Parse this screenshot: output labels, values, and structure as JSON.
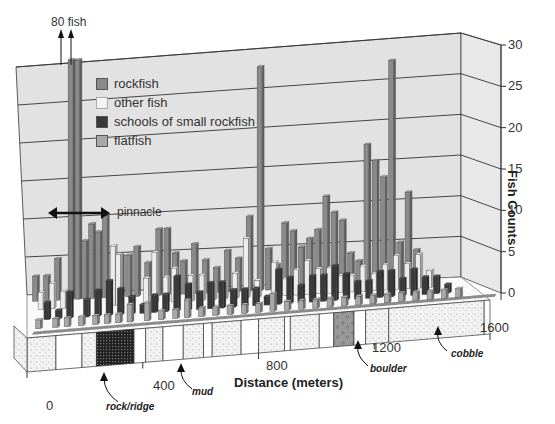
{
  "chart_data": {
    "type": "bar",
    "subtype": "3d-bar",
    "title": "",
    "xlabel": "Distance (meters)",
    "ylabel": "Fish Counts",
    "ylim": [
      0,
      30
    ],
    "xlim": [
      0,
      1600
    ],
    "yticks": [
      0,
      5,
      10,
      15,
      20,
      25,
      30
    ],
    "xticks": [
      0,
      400,
      800,
      1200,
      1600
    ],
    "grid": true,
    "legend_position": "upper-left inside",
    "legend": [
      {
        "name": "rockfish",
        "color": "#8a8a8a"
      },
      {
        "name": "other fish",
        "color": "#ececec"
      },
      {
        "name": "schools of small rockfish",
        "color": "#3a3a3a"
      },
      {
        "name": "flatfish",
        "color": "#a8a8a8"
      }
    ],
    "annotations": [
      {
        "text": "80 fish",
        "target": "two off-scale rockfish bars near 150 m",
        "value": 80
      },
      {
        "text": "pinnacle",
        "type": "double-arrow",
        "span_m": [
          60,
          260
        ]
      }
    ],
    "series": [
      {
        "name": "rockfish",
        "x": [
          20,
          60,
          100,
          150,
          175,
          200,
          225,
          250,
          275,
          330,
          360,
          390,
          430,
          470,
          500,
          530,
          560,
          600,
          640,
          680,
          720,
          760,
          800,
          840,
          870,
          900,
          930,
          960,
          990,
          1020,
          1050,
          1080,
          1110,
          1140,
          1170,
          1200,
          1230,
          1260,
          1290,
          1320,
          1350,
          1380,
          1410
        ],
        "values": [
          3,
          3,
          5,
          80,
          80,
          7,
          9,
          8,
          10,
          5,
          5,
          6,
          4,
          8,
          8,
          5,
          4,
          6,
          4,
          3,
          5,
          4,
          9,
          27,
          5,
          3,
          8,
          7,
          5,
          6,
          7,
          11,
          9,
          8,
          4,
          3,
          17,
          15,
          13,
          27,
          5,
          11,
          4
        ]
      },
      {
        "name": "other fish",
        "x": [
          40,
          80,
          120,
          300,
          320,
          420,
          450,
          490,
          520,
          580,
          620,
          660,
          700,
          740,
          780,
          820,
          880,
          920,
          960,
          1000,
          1040,
          1080,
          1120,
          1160,
          1200,
          1240,
          1280,
          1320,
          1360,
          1400,
          1440
        ],
        "values": [
          2,
          3,
          2,
          7,
          6,
          3,
          6,
          3,
          4,
          3,
          3,
          2,
          2,
          3,
          7,
          2,
          4,
          2,
          3,
          4,
          3,
          3,
          2,
          2,
          3,
          2,
          3,
          4,
          3,
          4,
          2
        ]
      },
      {
        "name": "schools of small rockfish",
        "x": [
          60,
          100,
          140,
          200,
          240,
          280,
          320,
          360,
          400,
          440,
          480,
          520,
          560,
          600,
          640,
          680,
          720,
          760,
          800,
          840,
          880,
          920,
          960,
          1000,
          1040,
          1080,
          1120,
          1160,
          1200,
          1240,
          1280,
          1320,
          1360,
          1400,
          1440,
          1480
        ],
        "values": [
          2,
          1,
          3,
          2,
          3,
          4,
          3,
          2,
          1,
          2,
          2,
          4,
          3,
          2,
          3,
          3,
          2,
          2,
          2,
          1,
          4,
          3,
          2,
          3,
          3,
          4,
          3,
          2,
          2,
          3,
          3,
          2,
          3,
          2,
          2,
          1
        ]
      },
      {
        "name": "flatfish",
        "x": [
          30,
          90,
          130,
          180,
          230,
          270,
          310,
          350,
          410,
          460,
          510,
          550,
          600,
          650,
          700,
          750,
          800,
          850,
          900,
          950,
          1000,
          1050,
          1100,
          1150,
          1200,
          1250,
          1300,
          1350,
          1400,
          1450,
          1500
        ],
        "values": [
          1,
          1,
          1,
          1,
          1,
          1,
          1,
          2,
          2,
          1,
          1,
          2,
          1,
          1,
          1,
          1,
          1,
          2,
          1,
          1,
          1,
          1,
          1,
          1,
          1,
          1,
          1,
          1,
          1,
          1,
          1
        ]
      }
    ],
    "substrate": {
      "segments": [
        {
          "from": 0,
          "to": 100,
          "type": "cobble"
        },
        {
          "from": 100,
          "to": 190,
          "type": "mud"
        },
        {
          "from": 190,
          "to": 240,
          "type": "cobble"
        },
        {
          "from": 240,
          "to": 370,
          "type": "rock/ridge"
        },
        {
          "from": 370,
          "to": 410,
          "type": "mud"
        },
        {
          "from": 410,
          "to": 470,
          "type": "cobble"
        },
        {
          "from": 470,
          "to": 540,
          "type": "mud"
        },
        {
          "from": 540,
          "to": 610,
          "type": "cobble"
        },
        {
          "from": 610,
          "to": 640,
          "type": "mud"
        },
        {
          "from": 640,
          "to": 740,
          "type": "cobble"
        },
        {
          "from": 740,
          "to": 800,
          "type": "mud"
        },
        {
          "from": 800,
          "to": 890,
          "type": "cobble"
        },
        {
          "from": 890,
          "to": 910,
          "type": "mud"
        },
        {
          "from": 910,
          "to": 1010,
          "type": "cobble"
        },
        {
          "from": 1010,
          "to": 1060,
          "type": "mud"
        },
        {
          "from": 1060,
          "to": 1130,
          "type": "boulder"
        },
        {
          "from": 1130,
          "to": 1170,
          "type": "mud"
        },
        {
          "from": 1170,
          "to": 1250,
          "type": "cobble"
        },
        {
          "from": 1250,
          "to": 1580,
          "type": "cobble"
        },
        {
          "from": 1580,
          "to": 1600,
          "type": "mud"
        }
      ],
      "labels": [
        {
          "text": "rock/ridge",
          "at_m": 300
        },
        {
          "text": "mud",
          "at_m": 470
        },
        {
          "text": "boulder",
          "at_m": 1090
        },
        {
          "text": "cobble",
          "at_m": 1380
        }
      ]
    }
  },
  "axis": {
    "y_title": "Fish Counts",
    "x_title": "Distance (meters)",
    "y_ticks": [
      "0",
      "5",
      "10",
      "15",
      "20",
      "25",
      "30"
    ],
    "x_ticks": [
      "0",
      "400",
      "800",
      "1200",
      "1600"
    ]
  },
  "annotations": {
    "off_scale": "80 fish",
    "pinnacle": "pinnacle"
  },
  "legend": [
    {
      "label": "rockfish",
      "color": "#8a8a8a"
    },
    {
      "label": "other fish",
      "color": "#ececec"
    },
    {
      "label": "schools of small rockfish",
      "color": "#3a3a3a"
    },
    {
      "label": "flatfish",
      "color": "#a8a8a8"
    }
  ],
  "substrate_labels": {
    "rock_ridge": "rock/ridge",
    "mud": "mud",
    "boulder": "boulder",
    "cobble": "cobble"
  }
}
